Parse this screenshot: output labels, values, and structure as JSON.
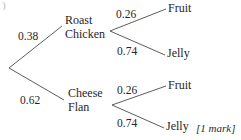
{
  "diagram": {
    "type": "probability-tree",
    "title": "",
    "root": {
      "label": "",
      "x": 8,
      "y": 68
    },
    "stroke_color": "#4a4a4a",
    "nodes": [
      {
        "id": "roast-chicken",
        "line1": "Roast",
        "line2": "Chicken",
        "x": 65,
        "y": 14
      },
      {
        "id": "cheese-flan",
        "line1": "Cheese",
        "line2": "Flan",
        "x": 68,
        "y": 87
      }
    ],
    "outcomes": [
      {
        "id": "fruit-top",
        "label": "Fruit",
        "x": 168,
        "y": 2
      },
      {
        "id": "jelly-top",
        "label": "Jelly",
        "x": 167,
        "y": 47
      },
      {
        "id": "fruit-bottom",
        "label": "Fruit",
        "x": 168,
        "y": 79
      },
      {
        "id": "jelly-bottom",
        "label": "Jelly",
        "x": 166,
        "y": 120
      }
    ],
    "probabilities": [
      {
        "id": "p-roast-chicken",
        "value": "0.38",
        "x": 18,
        "y": 30
      },
      {
        "id": "p-cheese-flan",
        "value": "0.62",
        "x": 20,
        "y": 94
      },
      {
        "id": "p-chicken-fruit",
        "value": "0.26",
        "x": 116,
        "y": 8
      },
      {
        "id": "p-chicken-jelly",
        "value": "0.74",
        "x": 117,
        "y": 45
      },
      {
        "id": "p-flan-fruit",
        "value": "0.26",
        "x": 117,
        "y": 84
      },
      {
        "id": "p-flan-jelly",
        "value": "0.74",
        "x": 117,
        "y": 117
      }
    ],
    "branches": [
      {
        "id": "branch-root-chicken",
        "x1": 9,
        "y1": 68,
        "x2": 62,
        "y2": 26
      },
      {
        "id": "branch-root-flan",
        "x1": 9,
        "y1": 68,
        "x2": 64,
        "y2": 100
      },
      {
        "id": "branch-chicken-fruit",
        "x1": 110,
        "y1": 31,
        "x2": 166,
        "y2": 9
      },
      {
        "id": "branch-chicken-jelly",
        "x1": 110,
        "y1": 31,
        "x2": 165,
        "y2": 55
      },
      {
        "id": "branch-flan-fruit",
        "x1": 112,
        "y1": 105,
        "x2": 166,
        "y2": 86
      },
      {
        "id": "branch-flan-jelly",
        "x1": 112,
        "y1": 105,
        "x2": 164,
        "y2": 128
      }
    ],
    "annotation": {
      "id": "marks-annotation",
      "label": "[1 mark]",
      "x": 196,
      "y": 122
    },
    "corner_mark": ")"
  }
}
